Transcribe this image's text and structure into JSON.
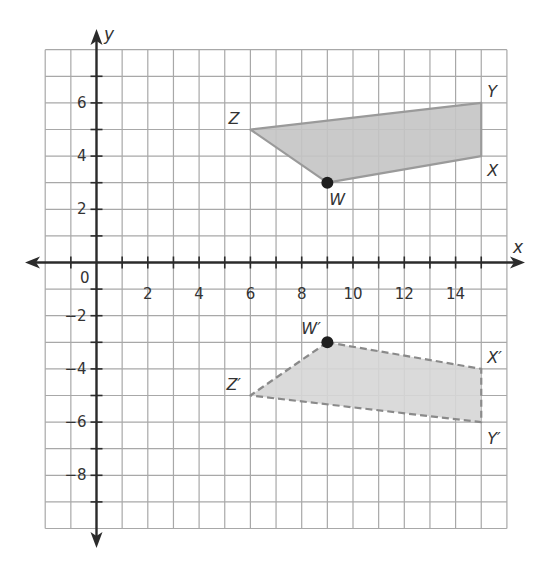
{
  "chart_data": {
    "type": "scatter",
    "title": "",
    "xlabel": "x",
    "ylabel": "y",
    "xlim": [
      -2,
      16
    ],
    "ylim": [
      -10,
      8
    ],
    "grid": true,
    "x_tick_labels": [
      {
        "value": 0,
        "label": "0"
      },
      {
        "value": 2,
        "label": "2"
      },
      {
        "value": 4,
        "label": "4"
      },
      {
        "value": 6,
        "label": "6"
      },
      {
        "value": 8,
        "label": "8"
      },
      {
        "value": 10,
        "label": "10"
      },
      {
        "value": 12,
        "label": "12"
      },
      {
        "value": 14,
        "label": "14"
      }
    ],
    "y_tick_labels": [
      {
        "value": 6,
        "label": "6"
      },
      {
        "value": 4,
        "label": "4"
      },
      {
        "value": 2,
        "label": "2"
      },
      {
        "value": -2,
        "label": "−2"
      },
      {
        "value": -4,
        "label": "−4"
      },
      {
        "value": -6,
        "label": "−6"
      },
      {
        "value": -8,
        "label": "−8"
      }
    ],
    "polygons": [
      {
        "name": "WXYZ",
        "style": "solid",
        "fill": "#c4c4c4",
        "stroke": "#9a9a9a",
        "vertices": [
          {
            "label": "W",
            "x": 9,
            "y": 3,
            "dot": true
          },
          {
            "label": "X",
            "x": 15,
            "y": 4,
            "dot": false
          },
          {
            "label": "Y",
            "x": 15,
            "y": 6,
            "dot": false
          },
          {
            "label": "Z",
            "x": 6,
            "y": 5,
            "dot": false
          }
        ]
      },
      {
        "name": "W'X'Y'Z'",
        "style": "dashed",
        "fill": "#d6d6d6",
        "stroke": "#8a8a8a",
        "vertices": [
          {
            "label": "W′",
            "x": 9,
            "y": -3,
            "dot": true
          },
          {
            "label": "X′",
            "x": 15,
            "y": -4,
            "dot": false
          },
          {
            "label": "Y′",
            "x": 15,
            "y": -6,
            "dot": false
          },
          {
            "label": "Z′",
            "x": 6,
            "y": -5,
            "dot": false
          }
        ]
      }
    ]
  },
  "labels": {
    "x_axis": "x",
    "y_axis": "y",
    "origin": "0",
    "W": "W",
    "X": "X",
    "Y": "Y",
    "Z": "Z",
    "W_prime": "W′",
    "X_prime": "X′",
    "Y_prime": "Y′",
    "Z_prime": "Z′"
  },
  "colors": {
    "grid": "#a8a8a8",
    "axis": "#2b2b2b",
    "point": "#1e1e1e"
  }
}
